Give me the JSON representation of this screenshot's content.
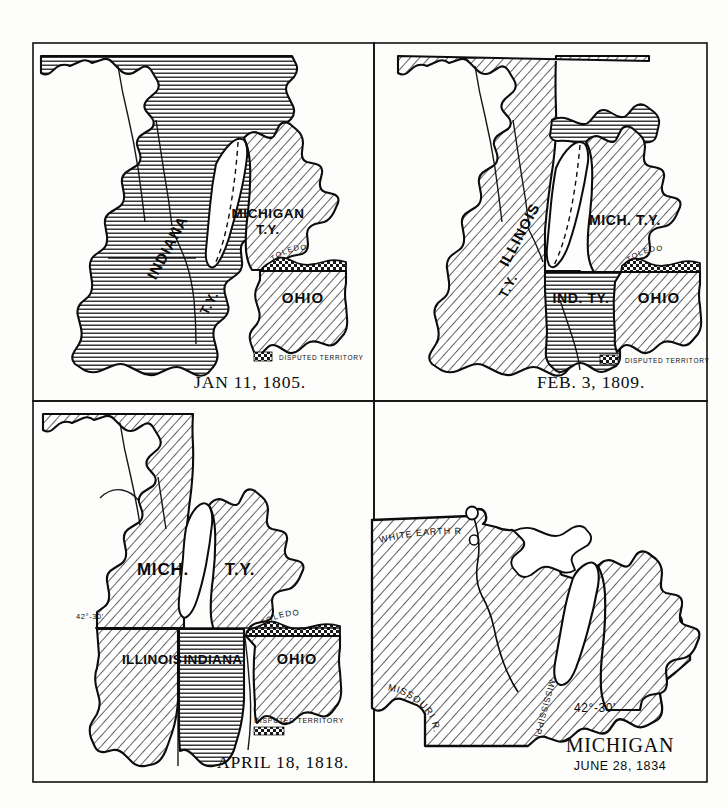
{
  "figure": {
    "kind": "four-panel historical map series",
    "background_color": "#fdfdfb",
    "ink_color": "#0c0c0c",
    "panel_border_color": "#111111"
  },
  "legend": {
    "disputed_label": "DISPUTED TERRITORY",
    "pattern": "checkered"
  },
  "panels": [
    {
      "id": "panel-1805",
      "caption": "JAN 11, 1805.",
      "position": "top-left",
      "regions": [
        {
          "name": "INDIANA",
          "label": "INDIANA",
          "sublabel": "T.Y.",
          "fill": "horizontal-hatch"
        },
        {
          "name": "MICHIGAN",
          "label": "MICHIGAN",
          "sublabel": "T.Y.",
          "fill": "diagonal-hatch"
        },
        {
          "name": "OHIO",
          "label": "OHIO",
          "sublabel": "",
          "fill": "diagonal-hatch"
        }
      ],
      "place_labels": [
        "TOLEDO"
      ],
      "boundary_labels": [],
      "legend_label": "DISPUTED TERRITORY"
    },
    {
      "id": "panel-1809",
      "caption": "FEB. 3, 1809.",
      "position": "top-right",
      "regions": [
        {
          "name": "ILLINOIS",
          "label": "ILLINOIS",
          "sublabel": "T.Y.",
          "fill": "diagonal-hatch"
        },
        {
          "name": "MICHIGAN",
          "label": "MICH. T.Y.",
          "sublabel": "",
          "fill": "diagonal-hatch"
        },
        {
          "name": "INDIANA",
          "label": "IND. TY.",
          "sublabel": "",
          "fill": "horizontal-hatch"
        },
        {
          "name": "OHIO",
          "label": "OHIO",
          "sublabel": "",
          "fill": "diagonal-hatch"
        }
      ],
      "place_labels": [
        "TOLEDO"
      ],
      "boundary_labels": [],
      "legend_label": "DISPUTED TERRITORY"
    },
    {
      "id": "panel-1818",
      "caption": "APRIL 18, 1818.",
      "position": "bottom-left",
      "regions": [
        {
          "name": "MICHIGAN",
          "label": "MICH.",
          "sublabel": "",
          "fill": "diagonal-hatch"
        },
        {
          "name": "MICHIGAN-EAST",
          "label": "T.Y.",
          "sublabel": "",
          "fill": "diagonal-hatch"
        },
        {
          "name": "ILLINOIS",
          "label": "ILLINOIS",
          "sublabel": "",
          "fill": "diagonal-hatch"
        },
        {
          "name": "INDIANA",
          "label": "INDIANA",
          "sublabel": "",
          "fill": "horizontal-hatch"
        },
        {
          "name": "OHIO",
          "label": "OHIO",
          "sublabel": "",
          "fill": "diagonal-hatch"
        }
      ],
      "place_labels": [
        "TOLEDO"
      ],
      "boundary_labels": [
        "42°-30'"
      ],
      "legend_label": "DISPUTED TERRITORY"
    },
    {
      "id": "panel-1834",
      "caption_title": "MICHIGAN",
      "caption_date": "JUNE 28, 1834",
      "position": "bottom-right",
      "regions": [
        {
          "name": "MICHIGAN-TERRITORY-1834",
          "label": "",
          "sublabel": "",
          "fill": "diagonal-hatch"
        }
      ],
      "place_labels": [
        "WHITE EARTH R.",
        "MISSOURI R.",
        "MISSISSIPPI"
      ],
      "boundary_labels": [
        "42°-30'"
      ],
      "legend_label": ""
    }
  ]
}
